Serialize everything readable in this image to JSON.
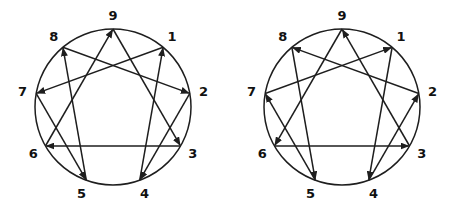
{
  "figure": {
    "background": "#ffffff",
    "line_color": "#1e1e1e",
    "label_color": "#111111",
    "diagrams": [
      {
        "position": "left",
        "point_labels": [
          "1",
          "2",
          "3",
          "4",
          "5",
          "6",
          "7",
          "8",
          "9"
        ],
        "arrows": [
          {
            "from": 1,
            "to": 7
          },
          {
            "from": 7,
            "to": 5
          },
          {
            "from": 5,
            "to": 8
          },
          {
            "from": 8,
            "to": 2
          },
          {
            "from": 2,
            "to": 4
          },
          {
            "from": 4,
            "to": 1
          },
          {
            "from": 9,
            "to": 3
          },
          {
            "from": 3,
            "to": 6
          },
          {
            "from": 6,
            "to": 9
          }
        ]
      },
      {
        "position": "right",
        "point_labels": [
          "1",
          "2",
          "3",
          "4",
          "5",
          "6",
          "7",
          "8",
          "9"
        ],
        "arrows": [
          {
            "from": 1,
            "to": 4
          },
          {
            "from": 4,
            "to": 2
          },
          {
            "from": 2,
            "to": 8
          },
          {
            "from": 8,
            "to": 5
          },
          {
            "from": 5,
            "to": 7
          },
          {
            "from": 7,
            "to": 1
          },
          {
            "from": 9,
            "to": 6
          },
          {
            "from": 6,
            "to": 3
          },
          {
            "from": 3,
            "to": 9
          }
        ]
      }
    ]
  }
}
